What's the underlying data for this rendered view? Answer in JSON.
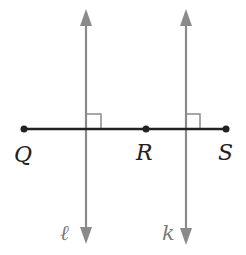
{
  "diagram": {
    "points": [
      {
        "name": "Q",
        "label": "Q"
      },
      {
        "name": "R",
        "label": "R"
      },
      {
        "name": "S",
        "label": "S"
      }
    ],
    "lines": [
      {
        "name": "l",
        "label": "ℓ"
      },
      {
        "name": "k",
        "label": "k"
      }
    ],
    "colors": {
      "segment": "#222222",
      "perpendicular_lines": "#8a8a8a",
      "label_point": "#222222",
      "label_line": "#7a7a7a"
    }
  }
}
